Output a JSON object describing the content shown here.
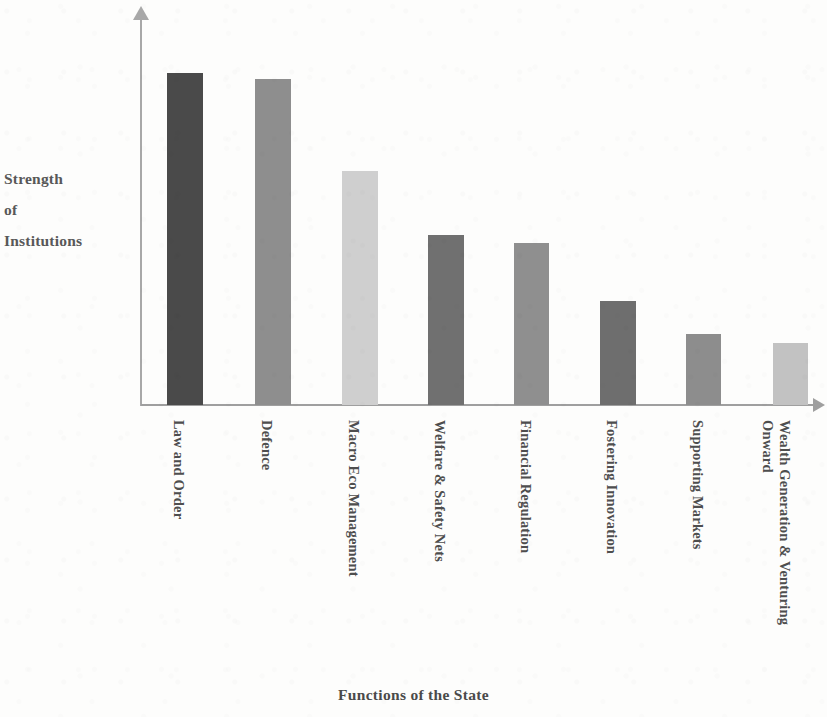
{
  "chart_data": {
    "type": "bar",
    "title": "",
    "xlabel": "Functions of the State",
    "ylabel": "Strength of Institutions",
    "ylabel_lines": [
      "Strength",
      "of",
      "Institutions"
    ],
    "categories": [
      "Law and Order",
      "Defence",
      "Macro Eco Management",
      "Welfare & Safety Nets",
      "Financial Regulation",
      "Fostering Innovation",
      "Supporting Markets",
      "Wealth Generation & Venturing Onward"
    ],
    "category_lines": [
      [
        "Law and Order"
      ],
      [
        "Defence"
      ],
      [
        "Macro Eco Management"
      ],
      [
        "Welfare & Safety Nets"
      ],
      [
        "Financial Regulation"
      ],
      [
        "Fostering Innovation"
      ],
      [
        "Supporting Markets"
      ],
      [
        "Wealth Generation & Venturing",
        "Onward"
      ]
    ],
    "values": [
      332,
      326,
      234,
      170,
      162,
      104,
      71,
      62
    ],
    "ylim": [
      0,
      395
    ],
    "grid": false,
    "legend": false,
    "axis_arrows": true,
    "bar_colors": [
      "#4a4a4a",
      "#8e8e8e",
      "#cfcfcf",
      "#707070",
      "#8f8f8f",
      "#6e6e6e",
      "#8d8d8d",
      "#c2c2c2"
    ],
    "bar_geometry": [
      {
        "x": 167,
        "width": 36
      },
      {
        "x": 255,
        "width": 36
      },
      {
        "x": 342,
        "width": 36
      },
      {
        "x": 428,
        "width": 36
      },
      {
        "x": 514,
        "width": 35
      },
      {
        "x": 600,
        "width": 36
      },
      {
        "x": 686,
        "width": 35
      },
      {
        "x": 773,
        "width": 35
      }
    ],
    "label_x_positions": [
      187,
      275,
      362,
      448,
      534,
      620,
      706,
      793
    ]
  },
  "colors": {
    "axis": "#a0a0a0",
    "text": "#4e4e4e",
    "background": "#fdfdfc"
  }
}
